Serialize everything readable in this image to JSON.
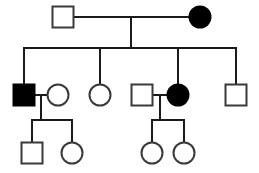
{
  "figure": {
    "kind": "pedigree-chart",
    "title": "",
    "background_color": "#ffffff",
    "line_color": "#1b1b1b",
    "symbol_stroke_color": "#3a3a3a",
    "affected_fill_color": "#000000",
    "unaffected_fill_color": "#ffffff",
    "width": 259,
    "height": 173
  },
  "legend": {
    "square_meaning": "male",
    "circle_meaning": "female",
    "filled_meaning": "affected",
    "open_meaning": "unaffected"
  },
  "chart_data": {
    "type": "diagram",
    "title": "",
    "generations": [
      {
        "id": "I",
        "label": "",
        "individuals": [
          {
            "id": "I-1",
            "sex": "male",
            "shape": "square",
            "status": "unaffected",
            "filled": false,
            "cx": 63,
            "cy": 17,
            "size": 21
          },
          {
            "id": "I-2",
            "sex": "female",
            "shape": "circle",
            "status": "affected",
            "filled": true,
            "cx": 200,
            "cy": 17,
            "size": 21
          }
        ]
      },
      {
        "id": "II",
        "label": "",
        "individuals": [
          {
            "id": "II-1",
            "sex": "male",
            "shape": "square",
            "status": "affected",
            "filled": true,
            "cx": 24,
            "cy": 95,
            "size": 21
          },
          {
            "id": "II-2",
            "sex": "female",
            "shape": "circle",
            "status": "unaffected",
            "filled": false,
            "cx": 58,
            "cy": 95,
            "size": 21
          },
          {
            "id": "II-3",
            "sex": "female",
            "shape": "circle",
            "status": "unaffected",
            "filled": false,
            "cx": 100,
            "cy": 95,
            "size": 21
          },
          {
            "id": "II-4",
            "sex": "male",
            "shape": "square",
            "status": "unaffected",
            "filled": false,
            "cx": 142,
            "cy": 95,
            "size": 21
          },
          {
            "id": "II-5",
            "sex": "female",
            "shape": "circle",
            "status": "affected",
            "filled": true,
            "cx": 178,
            "cy": 95,
            "size": 21
          },
          {
            "id": "II-6",
            "sex": "male",
            "shape": "square",
            "status": "unaffected",
            "filled": false,
            "cx": 236,
            "cy": 95,
            "size": 21
          }
        ]
      },
      {
        "id": "III",
        "label": "",
        "individuals": [
          {
            "id": "III-1",
            "sex": "male",
            "shape": "square",
            "status": "unaffected",
            "filled": false,
            "cx": 32,
            "cy": 153,
            "size": 21
          },
          {
            "id": "III-2",
            "sex": "female",
            "shape": "circle",
            "status": "unaffected",
            "filled": false,
            "cx": 72,
            "cy": 153,
            "size": 21
          },
          {
            "id": "III-3",
            "sex": "female",
            "shape": "circle",
            "status": "unaffected",
            "filled": false,
            "cx": 152,
            "cy": 153,
            "size": 21
          },
          {
            "id": "III-4",
            "sex": "female",
            "shape": "circle",
            "status": "unaffected",
            "filled": false,
            "cx": 184,
            "cy": 153,
            "size": 21
          }
        ]
      }
    ],
    "matings": [
      {
        "id": "M1",
        "partners": [
          "I-1",
          "I-2"
        ],
        "mating_line_y": 17,
        "x_from": 74,
        "x_to": 189,
        "descent_x": 131,
        "descent_to_y": 48
      },
      {
        "id": "M2",
        "partners": [
          "II-1",
          "II-2"
        ],
        "mating_line_y": 95,
        "x_from": 35,
        "x_to": 47,
        "descent_x": 41,
        "descent_to_y": 120
      },
      {
        "id": "M3",
        "partners": [
          "II-4",
          "II-5"
        ],
        "mating_line_y": 95,
        "x_from": 153,
        "x_to": 167,
        "descent_x": 160,
        "descent_to_y": 120
      }
    ],
    "sibships": [
      {
        "id": "S1",
        "parents": "M1",
        "sib_line_y": 48,
        "x_from": 24,
        "x_to": 236,
        "children": [
          "II-1",
          "II-3",
          "II-5",
          "II-6"
        ],
        "child_drop_x": [
          24,
          100,
          178,
          236
        ],
        "child_top_y": 85
      },
      {
        "id": "S2",
        "parents": "M2",
        "sib_line_y": 120,
        "x_from": 32,
        "x_to": 72,
        "children": [
          "III-1",
          "III-2"
        ],
        "child_drop_x": [
          32,
          72
        ],
        "child_top_y": 143
      },
      {
        "id": "S3",
        "parents": "M3",
        "sib_line_y": 120,
        "x_from": 152,
        "x_to": 184,
        "children": [
          "III-3",
          "III-4"
        ],
        "child_drop_x": [
          152,
          184
        ],
        "child_top_y": 143
      }
    ],
    "counts": {
      "total_individuals": 12,
      "affected_individuals": 3,
      "unaffected_individuals": 9,
      "males": 5,
      "females": 7,
      "generations": 3
    }
  }
}
